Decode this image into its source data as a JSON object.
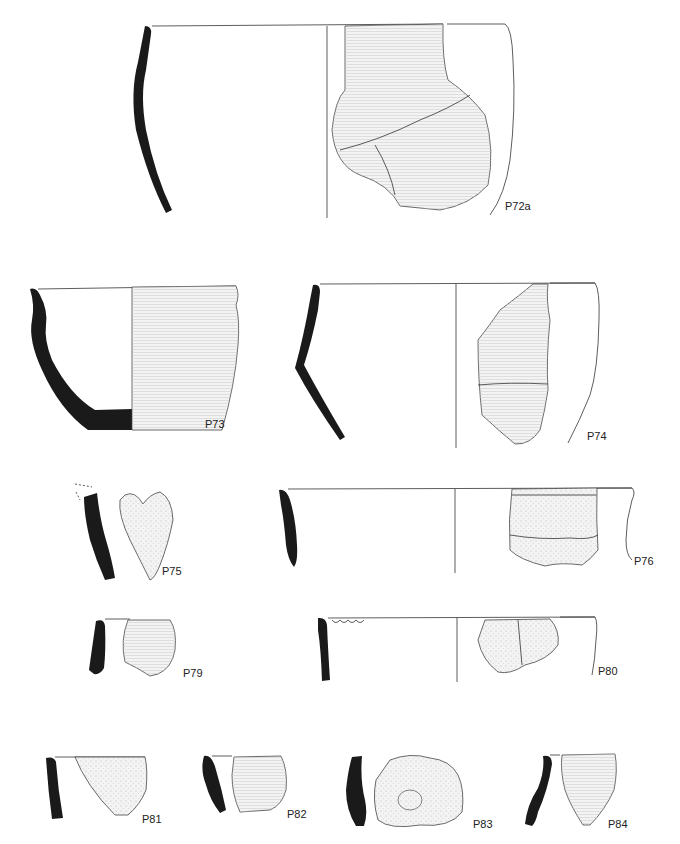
{
  "plate": {
    "title": "Pottery illustration plate",
    "accent_colors": {
      "section": "#1a1a1a",
      "line": "#333333",
      "sherd_fill": "#f3f3f3"
    }
  },
  "vessels": [
    {
      "id": "P72a",
      "label": "P72a"
    },
    {
      "id": "P73",
      "label": "P73"
    },
    {
      "id": "P74",
      "label": "P74"
    },
    {
      "id": "P75",
      "label": "P75"
    },
    {
      "id": "P76",
      "label": "P76"
    },
    {
      "id": "P79",
      "label": "P79"
    },
    {
      "id": "P80",
      "label": "P80"
    },
    {
      "id": "P81",
      "label": "P81"
    },
    {
      "id": "P82",
      "label": "P82"
    },
    {
      "id": "P83",
      "label": "P83"
    },
    {
      "id": "P84",
      "label": "P84"
    }
  ]
}
